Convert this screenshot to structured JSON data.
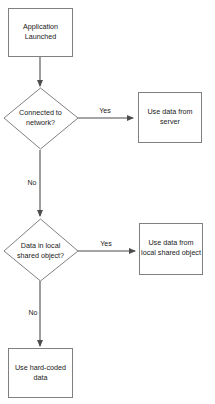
{
  "diagram": {
    "type": "flowchart",
    "background_color": "#ffffff",
    "node_fill_color": "#ffffff",
    "node_border_color": "#808080",
    "edge_color": "#4d4d4d",
    "text_color": "#1a1a1a",
    "nodes": [
      {
        "id": "start",
        "shape": "rectangle",
        "line1": "Application",
        "line2": "Launched"
      },
      {
        "id": "decision_network",
        "shape": "diamond",
        "line1": "Connected to",
        "line2": "network?"
      },
      {
        "id": "use_server",
        "shape": "rectangle",
        "line1": "Use data from",
        "line2": "server"
      },
      {
        "id": "decision_local",
        "shape": "diamond",
        "line1": "Data in local",
        "line2": "shared object?"
      },
      {
        "id": "use_local",
        "shape": "rectangle",
        "line1": "Use data from",
        "line2": "local shared object"
      },
      {
        "id": "use_hardcoded",
        "shape": "rectangle",
        "line1": "Use hard-coded",
        "line2": "data"
      }
    ],
    "edges": [
      {
        "id": "start-to-decision1",
        "from": "start",
        "to": "decision_network",
        "label": ""
      },
      {
        "id": "decision1-yes",
        "from": "decision_network",
        "to": "use_server",
        "label": "Yes"
      },
      {
        "id": "decision1-no",
        "from": "decision_network",
        "to": "decision_local",
        "label": "No"
      },
      {
        "id": "decision2-yes",
        "from": "decision_local",
        "to": "use_local",
        "label": "Yes"
      },
      {
        "id": "decision2-no",
        "from": "decision_local",
        "to": "use_hardcoded",
        "label": "No"
      }
    ]
  }
}
